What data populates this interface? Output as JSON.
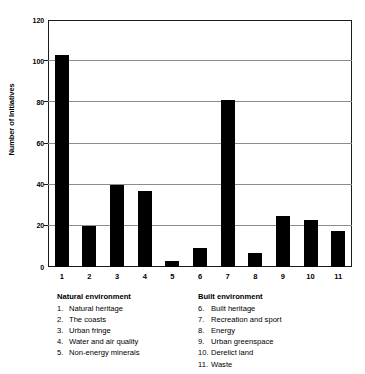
{
  "chart_data": {
    "type": "bar",
    "title": "",
    "xlabel": "",
    "ylabel": "Number of Initiatives",
    "categories": [
      "1",
      "2",
      "3",
      "4",
      "5",
      "6",
      "7",
      "8",
      "9",
      "10",
      "11"
    ],
    "values": [
      103,
      20,
      40,
      37,
      3,
      9,
      81,
      7,
      25,
      23,
      17.5
    ],
    "ylim": [
      0,
      120
    ],
    "yticks": [
      0,
      20,
      40,
      60,
      80,
      100,
      120
    ],
    "ytick_labels": [
      "0",
      "20",
      "40",
      "60",
      "80",
      "100",
      "120"
    ],
    "grid": true,
    "legend_position": "below-axes",
    "bar_color": "#000000",
    "grid_color": "#8c8c8c",
    "frame_color": "#1a1a1a"
  },
  "legend": {
    "groups": [
      {
        "title": "Natural environment",
        "items": [
          {
            "num": "1.",
            "label": "Natural heritage"
          },
          {
            "num": "2.",
            "label": "The coasts"
          },
          {
            "num": "3.",
            "label": "Urban fringe"
          },
          {
            "num": "4.",
            "label": "Water and air quality"
          },
          {
            "num": "5.",
            "label": "Non-energy minerals"
          }
        ]
      },
      {
        "title": "Built environment",
        "items": [
          {
            "num": "6.",
            "label": "Built heritage"
          },
          {
            "num": "7.",
            "label": "Recreation and sport"
          },
          {
            "num": "8.",
            "label": "Energy"
          },
          {
            "num": "9.",
            "label": "Urban greenspace"
          },
          {
            "num": "10.",
            "label": "Derelict land"
          },
          {
            "num": "11.",
            "label": "Waste"
          }
        ]
      }
    ]
  }
}
